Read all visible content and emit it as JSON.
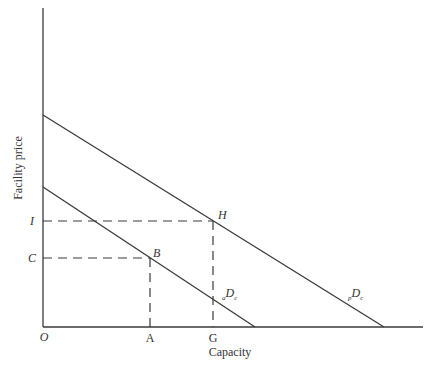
{
  "diagram": {
    "axes": {
      "x_label": "Capacity",
      "y_label": "Facility price",
      "origin_label": "O"
    },
    "x_ticks": [
      {
        "label": "A",
        "x": 150
      },
      {
        "label": "G",
        "x": 213
      }
    ],
    "y_ticks": [
      {
        "label": "I",
        "y": 221
      },
      {
        "label": "C",
        "y": 258
      }
    ],
    "points": [
      {
        "label": "H",
        "x": 213,
        "y": 221
      },
      {
        "label": "B",
        "x": 150,
        "y": 258
      }
    ],
    "curves": [
      {
        "name": "aDc",
        "subscript_pre": "a",
        "main": "D",
        "subscript_post": "c",
        "from": [
          43,
          187
        ],
        "to": [
          255,
          327
        ]
      },
      {
        "name": "pDc",
        "subscript_pre": "p",
        "main": "D",
        "subscript_post": "c",
        "from": [
          43,
          115
        ],
        "to": [
          384,
          327
        ]
      }
    ]
  }
}
